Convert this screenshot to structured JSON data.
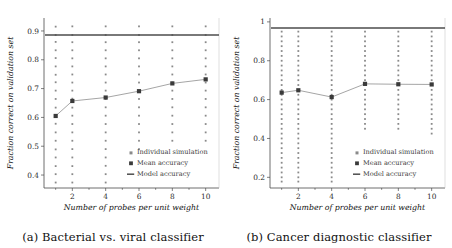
{
  "figure": {
    "panels": [
      {
        "id": "panel-a",
        "caption": "(a) Bacterial vs. viral classifier",
        "xlabel": "Number of probes per unit weight",
        "ylabel": "Fraction correct on validation set",
        "legend": {
          "individual": "Individual simulation",
          "mean": "Mean accuracy",
          "model": "Model accuracy"
        }
      },
      {
        "id": "panel-b",
        "caption": "(b) Cancer diagnostic classifier",
        "xlabel": "Number of probes per unit weight",
        "ylabel": "Fraction correct on validation set",
        "legend": {
          "individual": "Individual simulation",
          "mean": "Mean accuracy",
          "model": "Model accuracy"
        }
      }
    ]
  },
  "chart_data": [
    {
      "type": "scatter",
      "title": "(a) Bacterial vs. viral classifier",
      "xlabel": "Number of probes per unit weight",
      "ylabel": "Fraction correct on validation set",
      "xlim": [
        0.3,
        10.8
      ],
      "ylim": [
        0.355,
        0.945
      ],
      "xticks": [
        2,
        4,
        6,
        8,
        10
      ],
      "xticklabels": [
        "2",
        "4",
        "6",
        "8",
        "10"
      ],
      "yticks": [
        0.4,
        0.5,
        0.6,
        0.7,
        0.8,
        0.9
      ],
      "yticklabels": [
        "0.4",
        "0.5",
        "0.6",
        "0.7",
        "0.8",
        "0.9"
      ],
      "grid": false,
      "legend_position": "lower right",
      "series": [
        {
          "name": "Mean accuracy",
          "type": "line-marker",
          "x": [
            1,
            2,
            4,
            6,
            8,
            10
          ],
          "values": [
            0.605,
            0.657,
            0.669,
            0.691,
            0.718,
            0.732
          ]
        },
        {
          "name": "Model accuracy",
          "type": "hline",
          "value": 0.886
        },
        {
          "name": "Individual simulation",
          "type": "scatter-columns",
          "columns": [
            {
              "x": 1,
              "values": [
                0.915,
                0.886,
                0.862,
                0.833,
                0.806,
                0.777,
                0.748,
                0.722,
                0.693,
                0.664,
                0.634,
                0.606,
                0.578,
                0.548,
                0.519,
                0.489,
                0.461,
                0.431,
                0.403,
                0.374
              ]
            },
            {
              "x": 2,
              "values": [
                0.916,
                0.886,
                0.861,
                0.833,
                0.805,
                0.777,
                0.749,
                0.721,
                0.693,
                0.665,
                0.634,
                0.606,
                0.577,
                0.548,
                0.519,
                0.49,
                0.461,
                0.431,
                0.403,
                0.374
              ]
            },
            {
              "x": 4,
              "values": [
                0.916,
                0.886,
                0.861,
                0.833,
                0.805,
                0.777,
                0.749,
                0.721,
                0.693,
                0.664,
                0.635,
                0.606,
                0.577,
                0.548,
                0.519,
                0.49,
                0.461,
                0.432,
                0.403,
                0.374
              ]
            },
            {
              "x": 6,
              "values": [
                0.916,
                0.886,
                0.861,
                0.833,
                0.805,
                0.777,
                0.749,
                0.721,
                0.693,
                0.664,
                0.635,
                0.606,
                0.577,
                0.548,
                0.519,
                0.49
              ]
            },
            {
              "x": 8,
              "values": [
                0.916,
                0.886,
                0.861,
                0.833,
                0.805,
                0.777,
                0.749,
                0.721,
                0.693,
                0.664,
                0.635,
                0.606,
                0.577,
                0.548,
                0.519
              ]
            },
            {
              "x": 10,
              "values": [
                0.916,
                0.886,
                0.861,
                0.833,
                0.805,
                0.777,
                0.749,
                0.721,
                0.693,
                0.664,
                0.635,
                0.606,
                0.577,
                0.548,
                0.519
              ]
            }
          ]
        }
      ]
    },
    {
      "type": "scatter",
      "title": "(b) Cancer diagnostic classifier",
      "xlabel": "Number of probes per unit weight",
      "ylabel": "Fraction correct on validation set",
      "xlim": [
        0.3,
        10.8
      ],
      "ylim": [
        0.145,
        1.02
      ],
      "xticks": [
        2,
        4,
        6,
        8,
        10
      ],
      "xticklabels": [
        "2",
        "4",
        "6",
        "8",
        "10"
      ],
      "yticks": [
        0.2,
        0.4,
        0.6,
        0.8,
        1.0
      ],
      "yticklabels": [
        "0.2",
        "0.4",
        "0.6",
        "0.8",
        "1"
      ],
      "grid": false,
      "legend_position": "lower right",
      "series": [
        {
          "name": "Mean accuracy",
          "type": "line-marker",
          "x": [
            1,
            2,
            4,
            6,
            8,
            10
          ],
          "values": [
            0.636,
            0.648,
            0.613,
            0.681,
            0.679,
            0.678
          ]
        },
        {
          "name": "Model accuracy",
          "type": "hline",
          "value": 0.968
        },
        {
          "name": "Individual simulation",
          "type": "scatter-columns",
          "columns": [
            {
              "x": 1,
              "values": [
                0.95,
                0.925,
                0.9,
                0.875,
                0.85,
                0.825,
                0.8,
                0.775,
                0.75,
                0.725,
                0.7,
                0.675,
                0.65,
                0.625,
                0.6,
                0.575,
                0.55,
                0.525,
                0.5,
                0.475,
                0.45,
                0.425,
                0.4,
                0.375,
                0.35,
                0.325,
                0.3,
                0.275,
                0.25,
                0.225,
                0.2,
                0.178
              ]
            },
            {
              "x": 2,
              "values": [
                0.95,
                0.925,
                0.9,
                0.875,
                0.85,
                0.825,
                0.8,
                0.775,
                0.75,
                0.725,
                0.7,
                0.675,
                0.65,
                0.625,
                0.6,
                0.575,
                0.55,
                0.525,
                0.5,
                0.475,
                0.45,
                0.425,
                0.4,
                0.375,
                0.35,
                0.325,
                0.3,
                0.275,
                0.25,
                0.225,
                0.2,
                0.178
              ]
            },
            {
              "x": 4,
              "values": [
                0.95,
                0.925,
                0.9,
                0.875,
                0.85,
                0.825,
                0.8,
                0.775,
                0.75,
                0.725,
                0.7,
                0.675,
                0.65,
                0.625,
                0.6,
                0.575,
                0.55,
                0.525,
                0.5,
                0.475,
                0.45,
                0.425,
                0.4,
                0.375,
                0.35,
                0.325,
                0.3,
                0.275,
                0.25,
                0.225,
                0.2,
                0.178
              ]
            },
            {
              "x": 6,
              "values": [
                0.95,
                0.925,
                0.9,
                0.875,
                0.85,
                0.825,
                0.8,
                0.775,
                0.75,
                0.725,
                0.7,
                0.675,
                0.65,
                0.625,
                0.6,
                0.575,
                0.55,
                0.525,
                0.5,
                0.475,
                0.45
              ]
            },
            {
              "x": 8,
              "values": [
                0.95,
                0.925,
                0.9,
                0.875,
                0.85,
                0.825,
                0.8,
                0.775,
                0.75,
                0.725,
                0.7,
                0.675,
                0.65,
                0.625,
                0.6,
                0.575,
                0.55,
                0.525,
                0.5,
                0.475,
                0.45
              ]
            },
            {
              "x": 10,
              "values": [
                0.95,
                0.925,
                0.9,
                0.875,
                0.85,
                0.825,
                0.8,
                0.775,
                0.75,
                0.725,
                0.7,
                0.675,
                0.65,
                0.625,
                0.6,
                0.575,
                0.55,
                0.525,
                0.5,
                0.475,
                0.45,
                0.425
              ]
            }
          ]
        }
      ]
    }
  ]
}
